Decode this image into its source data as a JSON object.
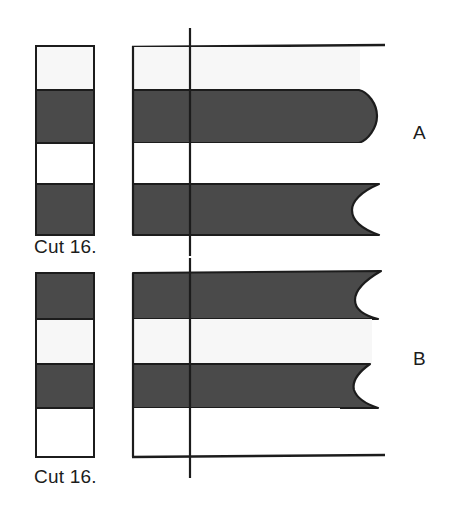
{
  "figure": {
    "background_color": "#ffffff",
    "width": 456,
    "height": 516
  },
  "colors": {
    "dark_band": "#4a4a4a",
    "light_band": "#f7f7f7",
    "white_band": "#ffffff",
    "outline": "#1c1c1c",
    "text": "#1c1c1c"
  },
  "panels": [
    {
      "id": "A",
      "letter": "A",
      "cut_label": "Cut 16.",
      "key_column": {
        "x": 36,
        "y": 46,
        "width": 58,
        "height": 189,
        "bands": [
          {
            "index": 0,
            "fill": "light",
            "y": 46,
            "height": 44
          },
          {
            "index": 1,
            "fill": "dark",
            "y": 90,
            "height": 53
          },
          {
            "index": 2,
            "fill": "white",
            "y": 143,
            "height": 41
          },
          {
            "index": 3,
            "fill": "dark",
            "y": 184,
            "height": 51
          }
        ]
      },
      "profile": {
        "left_x": 132,
        "top_y": 46,
        "bottom_y": 235,
        "baseline_extent_x": 385,
        "bands": [
          {
            "index": 0,
            "fill": "light",
            "y": 46,
            "height": 44,
            "right_edge": "open"
          },
          {
            "index": 1,
            "fill": "dark",
            "y": 90,
            "height": 53,
            "right_edge": "convex",
            "tip_x": 372
          },
          {
            "index": 2,
            "fill": "white",
            "y": 143,
            "height": 41,
            "right_edge": "open"
          },
          {
            "index": 3,
            "fill": "dark",
            "y": 184,
            "height": 51,
            "right_edge": "concave",
            "tip_x": 372
          }
        ]
      },
      "reference_line": {
        "x": 190,
        "y_top": 28,
        "y_bottom": 256
      },
      "top_rule": {
        "y": 46,
        "x_start": 132,
        "x_end": 385
      }
    },
    {
      "id": "B",
      "letter": "B",
      "cut_label": "Cut 16.",
      "key_column": {
        "x": 36,
        "y": 273,
        "width": 58,
        "height": 184,
        "bands": [
          {
            "index": 0,
            "fill": "dark",
            "y": 273,
            "height": 46
          },
          {
            "index": 1,
            "fill": "light",
            "y": 319,
            "height": 45
          },
          {
            "index": 2,
            "fill": "dark",
            "y": 364,
            "height": 44
          },
          {
            "index": 3,
            "fill": "white",
            "y": 408,
            "height": 49
          }
        ]
      },
      "profile": {
        "left_x": 132,
        "top_y": 273,
        "bottom_y": 457,
        "baseline_extent_x": 385,
        "bands": [
          {
            "index": 0,
            "fill": "dark",
            "y": 273,
            "height": 46,
            "right_edge": "concave",
            "tip_x": 372
          },
          {
            "index": 1,
            "fill": "light",
            "y": 319,
            "height": 45,
            "right_edge": "open"
          },
          {
            "index": 2,
            "fill": "dark",
            "y": 364,
            "height": 44,
            "right_edge": "concave",
            "tip_x": 372
          },
          {
            "index": 3,
            "fill": "white",
            "y": 408,
            "height": 49,
            "right_edge": "open"
          }
        ]
      },
      "reference_line": {
        "x": 190,
        "y_top": 258,
        "y_bottom": 478
      },
      "bottom_rule": {
        "y": 457,
        "x_start": 132,
        "x_end": 385
      }
    }
  ]
}
